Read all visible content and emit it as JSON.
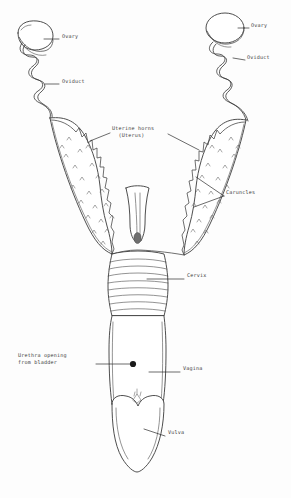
{
  "diagram": {
    "style": "hand-drawn pen line art, monochrome",
    "background_color": "#fdfdfd",
    "ink_color": "#3a3a3a",
    "labels": [
      {
        "id": "ovary-left",
        "text": "Ovary",
        "side": "right",
        "x": 62,
        "y": 36,
        "leader_from": [
          59,
          39
        ],
        "leader_to": [
          42,
          39
        ]
      },
      {
        "id": "oviduct-left",
        "text": "Oviduct",
        "side": "right",
        "x": 62,
        "y": 81,
        "leader_from": [
          59,
          84
        ],
        "leader_to": [
          44,
          84
        ]
      },
      {
        "id": "ovary-right",
        "text": "Ovary",
        "side": "right",
        "x": 251,
        "y": 25,
        "leader_from": [
          249,
          28
        ],
        "leader_to": [
          236,
          28
        ]
      },
      {
        "id": "oviduct-right",
        "text": "Oviduct",
        "side": "right",
        "x": 247,
        "y": 57,
        "leader_from": [
          245,
          60
        ],
        "leader_to": [
          233,
          57
        ]
      },
      {
        "id": "uterine-horns",
        "text": "Uterine horns\n  (Uterus)",
        "side": "center",
        "x": 112,
        "y": 128,
        "leader_from": [
          110,
          133
        ],
        "leader_to": [
          92,
          140
        ],
        "leader_from_2": [
          168,
          133
        ],
        "leader_to_2": [
          196,
          148
        ]
      },
      {
        "id": "caruncles",
        "text": "Caruncles",
        "side": "right",
        "x": 226,
        "y": 192,
        "leader_from": [
          224,
          196
        ],
        "leader_to": [
          197,
          178
        ],
        "leader_from_2": [
          224,
          196
        ],
        "leader_to_2": [
          194,
          206
        ]
      },
      {
        "id": "cervix",
        "text": "Cervix",
        "side": "right",
        "x": 186,
        "y": 275,
        "leader_from": [
          184,
          279
        ],
        "leader_to": [
          146,
          279
        ]
      },
      {
        "id": "urethra-opening",
        "text": "Urethra opening\nfrom bladder",
        "side": "left",
        "x": 18,
        "y": 355,
        "leader_from": [
          96,
          364
        ],
        "leader_to": [
          132,
          364
        ]
      },
      {
        "id": "vagina",
        "text": "Vagina",
        "side": "right",
        "x": 182,
        "y": 368,
        "leader_from": [
          180,
          372
        ],
        "leader_to": [
          148,
          372
        ]
      },
      {
        "id": "vulva",
        "text": "Vulva",
        "side": "right",
        "x": 167,
        "y": 432,
        "leader_from": [
          165,
          436
        ],
        "leader_to": [
          143,
          429
        ]
      }
    ],
    "structures": [
      {
        "id": "ovary-left",
        "name": "Left ovary",
        "shape": "oval-bean"
      },
      {
        "id": "ovary-right",
        "name": "Right ovary",
        "shape": "round-egg"
      },
      {
        "id": "oviduct-left",
        "name": "Left oviduct",
        "shape": "coiled-tube"
      },
      {
        "id": "oviduct-right",
        "name": "Right oviduct",
        "shape": "coiled-tube"
      },
      {
        "id": "horn-left",
        "name": "Left uterine horn",
        "shape": "tapered-scalloped"
      },
      {
        "id": "horn-right",
        "name": "Right uterine horn",
        "shape": "tapered-scalloped"
      },
      {
        "id": "uterine-body",
        "name": "Uterine body",
        "shape": "short-tube"
      },
      {
        "id": "cervix",
        "name": "Cervix",
        "shape": "ringed-barrel"
      },
      {
        "id": "vagina",
        "name": "Vagina",
        "shape": "long-tube"
      },
      {
        "id": "vulva",
        "name": "Vulva",
        "shape": "lobed-lips"
      },
      {
        "id": "urethral-opening",
        "name": "Urethral opening",
        "shape": "filled-dot"
      }
    ]
  }
}
